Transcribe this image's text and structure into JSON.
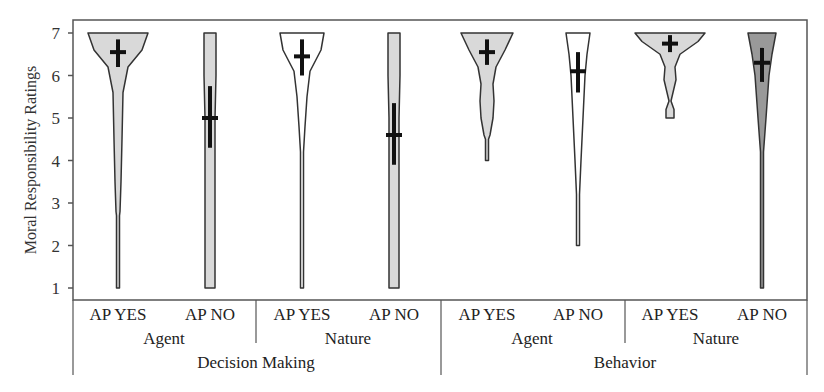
{
  "chart_data": {
    "type": "violin",
    "title": "",
    "xlabel": "",
    "ylabel": "Moral Responsibility Ratings",
    "ylim": [
      1,
      7
    ],
    "yticks": [
      1,
      2,
      3,
      4,
      5,
      6,
      7
    ],
    "grid": false,
    "legend": null,
    "x_hierarchy": {
      "level1": [
        "AP YES",
        "AP NO",
        "AP YES",
        "AP NO",
        "AP YES",
        "AP NO",
        "AP YES",
        "AP NO"
      ],
      "level2": [
        "Agent",
        "Nature",
        "Agent",
        "Nature"
      ],
      "level3": [
        "Decision Making",
        "Behavior"
      ]
    },
    "series": [
      {
        "name": "Decision Making / Agent / AP YES",
        "group": "Decision Making",
        "subgroup": "Agent",
        "condition": "AP YES",
        "fill": "#d9d9d9",
        "range": [
          1,
          7
        ],
        "mean": 6.55,
        "ci": [
          6.2,
          6.85
        ],
        "shape": [
          [
            7,
            30
          ],
          [
            6.6,
            24
          ],
          [
            6.2,
            10
          ],
          [
            5.6,
            5
          ],
          [
            4.5,
            4
          ],
          [
            3.5,
            3
          ],
          [
            2.8,
            2
          ],
          [
            2.7,
            1.5
          ],
          [
            1,
            1.5
          ]
        ]
      },
      {
        "name": "Decision Making / Agent / AP NO",
        "group": "Decision Making",
        "subgroup": "Agent",
        "condition": "AP NO",
        "fill": "#d9d9d9",
        "range": [
          1,
          7
        ],
        "mean": 5.0,
        "ci": [
          4.3,
          5.75
        ],
        "shape": [
          [
            7,
            6
          ],
          [
            6,
            6
          ],
          [
            5,
            5
          ],
          [
            4,
            5
          ],
          [
            3,
            5
          ],
          [
            2,
            5
          ],
          [
            1,
            5
          ]
        ]
      },
      {
        "name": "Decision Making / Nature / AP YES",
        "group": "Decision Making",
        "subgroup": "Nature",
        "condition": "AP YES",
        "fill": "#ffffff",
        "range": [
          1,
          7
        ],
        "mean": 6.45,
        "ci": [
          6.0,
          6.85
        ],
        "shape": [
          [
            7,
            22
          ],
          [
            6.6,
            19
          ],
          [
            6.1,
            8
          ],
          [
            5.5,
            5
          ],
          [
            4.8,
            3
          ],
          [
            4.2,
            1.5
          ],
          [
            1,
            1.5
          ]
        ]
      },
      {
        "name": "Decision Making / Nature / AP NO",
        "group": "Decision Making",
        "subgroup": "Nature",
        "condition": "AP NO",
        "fill": "#d9d9d9",
        "range": [
          1,
          7
        ],
        "mean": 4.6,
        "ci": [
          3.9,
          5.35
        ],
        "shape": [
          [
            7,
            6
          ],
          [
            6,
            6
          ],
          [
            5,
            5
          ],
          [
            4,
            5
          ],
          [
            3,
            5
          ],
          [
            2,
            5
          ],
          [
            1,
            5
          ]
        ]
      },
      {
        "name": "Behavior / Agent / AP YES",
        "group": "Behavior",
        "subgroup": "Agent",
        "condition": "AP YES",
        "fill": "#d9d9d9",
        "range": [
          4,
          7
        ],
        "mean": 6.55,
        "ci": [
          6.25,
          6.85
        ],
        "shape": [
          [
            7,
            26
          ],
          [
            6.6,
            18
          ],
          [
            6.2,
            9
          ],
          [
            5.8,
            6
          ],
          [
            5.4,
            7
          ],
          [
            5.0,
            6
          ],
          [
            4.6,
            3
          ],
          [
            4.5,
            1.5
          ],
          [
            4,
            1.5
          ]
        ]
      },
      {
        "name": "Behavior / Agent / AP NO",
        "group": "Behavior",
        "subgroup": "Agent",
        "condition": "AP NO",
        "fill": "#ffffff",
        "range": [
          2,
          7
        ],
        "mean": 6.1,
        "ci": [
          5.6,
          6.55
        ],
        "shape": [
          [
            7,
            12
          ],
          [
            6.5,
            9
          ],
          [
            6.0,
            7
          ],
          [
            5.0,
            5
          ],
          [
            4.0,
            3
          ],
          [
            3.2,
            1.5
          ],
          [
            2,
            1.5
          ]
        ]
      },
      {
        "name": "Behavior / Nature / AP YES",
        "group": "Behavior",
        "subgroup": "Nature",
        "condition": "AP YES",
        "fill": "#d9d9d9",
        "range": [
          5,
          7
        ],
        "mean": 6.75,
        "ci": [
          6.55,
          6.95
        ],
        "shape": [
          [
            7,
            35
          ],
          [
            6.8,
            28
          ],
          [
            6.5,
            10
          ],
          [
            6.2,
            5
          ],
          [
            5.9,
            6
          ],
          [
            5.6,
            3
          ],
          [
            5.4,
            1
          ],
          [
            5.2,
            4
          ],
          [
            5,
            4
          ]
        ]
      },
      {
        "name": "Behavior / Nature / AP NO",
        "group": "Behavior",
        "subgroup": "Nature",
        "condition": "AP NO",
        "fill": "#999999",
        "range": [
          1,
          7
        ],
        "mean": 6.3,
        "ci": [
          5.85,
          6.65
        ],
        "shape": [
          [
            7,
            14
          ],
          [
            6.5,
            10
          ],
          [
            6.0,
            7
          ],
          [
            5.0,
            4
          ],
          [
            4.2,
            1.5
          ],
          [
            1,
            1.5
          ]
        ]
      }
    ]
  }
}
